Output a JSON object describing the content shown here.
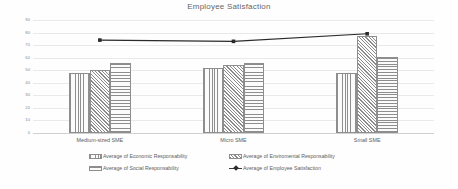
{
  "chart_data": {
    "type": "bar",
    "title": "Employee Satisfaction",
    "xlabel": "",
    "ylabel": "",
    "ylim": [
      0,
      90
    ],
    "ytick_step": 10,
    "yticks": [
      "0",
      "10",
      "20",
      "30",
      "40",
      "50",
      "60",
      "70",
      "80",
      "90"
    ],
    "grid": true,
    "legend_position": "bottom",
    "categories": [
      "Medium-sized SME",
      "Micro SME",
      "Small SME"
    ],
    "series": [
      {
        "name": "Average of Economic Responsability",
        "type": "bar",
        "pattern": "vertical-lines",
        "values": [
          48,
          52,
          48
        ]
      },
      {
        "name": "Average of Enviromental Responsability",
        "type": "bar",
        "pattern": "diagonal-crosshatch",
        "values": [
          50,
          54,
          77
        ]
      },
      {
        "name": "Average of Social Responsability",
        "type": "bar",
        "pattern": "horizontal-lines",
        "values": [
          56,
          56,
          60.5
        ]
      },
      {
        "name": "Average of Employee Satisfaction",
        "type": "line",
        "marker": "square",
        "color": "#2b2b2b",
        "values": [
          74,
          73,
          79
        ]
      }
    ]
  },
  "legend": {
    "rows": [
      [
        {
          "label": "Average of Economic Responsability",
          "marker": "swatch-vertical"
        },
        {
          "label": "Average of Enviromental Responsability",
          "marker": "swatch-crosshatch"
        }
      ],
      [
        {
          "label": "Average of Social Responsability",
          "marker": "swatch-horizontal"
        },
        {
          "label": "Average of Employee Satisfaction",
          "marker": "line-marker"
        }
      ]
    ]
  },
  "colors": {
    "background": "#fefefe",
    "gridline": "#e9e9e9",
    "axis": "#d0d0d0",
    "bar_outline": "#8e8e8e",
    "bar_fill": "#f2f2f2",
    "line": "#2b2b2b",
    "text": "#5d5d5d",
    "title_text": "#666666"
  }
}
